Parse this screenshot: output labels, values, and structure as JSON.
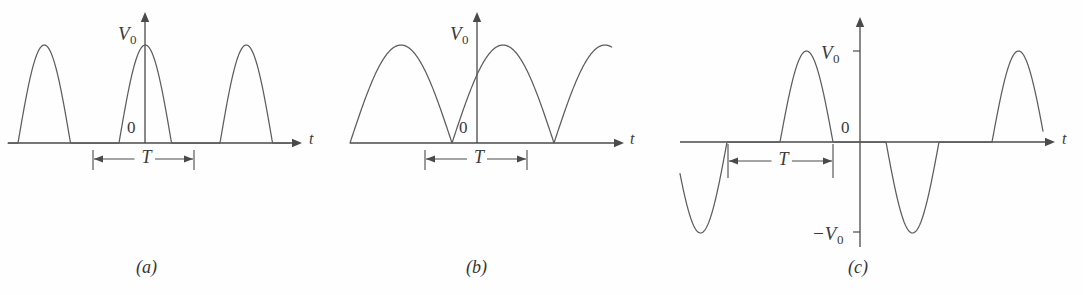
{
  "figure": {
    "width": 1083,
    "height": 295,
    "background": "#fefefe",
    "line_color": "#5d5d5d",
    "axis_color": "#4a4a4a",
    "text_color": "#3a3a3a"
  },
  "panels": [
    {
      "id": "a",
      "caption": "(a)",
      "caption_x": 148,
      "caption_y": 258,
      "waveform_type": "half-wave-rectified-sine",
      "amplitude_label": "V",
      "amplitude_sub": "0",
      "amplitude_label_x": 118,
      "amplitude_label_y": 24,
      "zero_label": "0",
      "zero_label_x": 127,
      "zero_label_y": 119,
      "time_axis_label": "t",
      "time_axis_label_x": 309,
      "time_axis_label_y": 131,
      "period_label": "T",
      "origin_x": 145,
      "baseline_y": 143,
      "amplitude_px": 98,
      "period_px": 101,
      "duty": 0.52,
      "phase_offset_px": -26,
      "wave_start_x": 8,
      "wave_end_x": 290,
      "axis_x_start": 8,
      "axis_x_end": 302,
      "axis_y_top": 12,
      "dim_y": 159,
      "dim_x1": 93,
      "dim_x2": 194,
      "dim_tick_top": 150,
      "dim_tick_bottom": 170
    },
    {
      "id": "b",
      "caption": "(b)",
      "caption_x": 478,
      "caption_y": 258,
      "waveform_type": "full-wave-rectified-sine",
      "amplitude_label": "V",
      "amplitude_sub": "0",
      "amplitude_label_x": 450,
      "amplitude_label_y": 24,
      "zero_label": "0",
      "zero_label_x": 459,
      "zero_label_y": 119,
      "time_axis_label": "t",
      "time_axis_label_x": 630,
      "time_axis_label_y": 131,
      "period_label": "T",
      "origin_x": 477,
      "baseline_y": 143,
      "amplitude_px": 98,
      "period_px": 102,
      "duty": 1.0,
      "phase_offset_px": -25,
      "wave_start_x": 350,
      "wave_end_x": 612,
      "axis_x_start": 350,
      "axis_x_end": 624,
      "axis_y_top": 12,
      "dim_y": 159,
      "dim_x1": 425,
      "dim_x2": 527,
      "dim_tick_top": 150,
      "dim_tick_bottom": 170
    },
    {
      "id": "c",
      "caption": "(c)",
      "caption_x": 860,
      "caption_y": 258,
      "waveform_type": "alternating-gapped-sine",
      "amplitude_label": "V",
      "amplitude_sub": "0",
      "amplitude_label_x": 821,
      "amplitude_label_y": 43,
      "neg_amplitude_label": "−V",
      "neg_amplitude_sub": "0",
      "neg_amplitude_label_x": 812,
      "neg_amplitude_label_y": 224,
      "zero_label": "0",
      "zero_label_x": 841,
      "zero_label_y": 119,
      "time_axis_label": "t",
      "time_axis_label_x": 1062,
      "time_axis_label_y": 131,
      "period_label": "T",
      "origin_x": 860,
      "baseline_y": 142,
      "amplitude_px": 91,
      "period_px": 106,
      "duty": 0.5,
      "phase_offset_px": -80,
      "wave_start_x": 680,
      "wave_end_x": 1043,
      "axis_x_start": 680,
      "axis_x_end": 1055,
      "axis_y_top": 17,
      "axis_y_bottom": 247,
      "tick_pos_y": 51,
      "tick_neg_y": 232,
      "tick_len": 7,
      "dim_y": 161,
      "dim_x1": 728,
      "dim_x2": 833,
      "dim_tick_top": 144,
      "dim_tick_bottom": 178
    }
  ],
  "chart_data": {
    "type": "line",
    "xlabel": "t",
    "ylabel": "V",
    "grid": false,
    "legend": "none",
    "series": [
      {
        "name": "(a) half-wave rectified",
        "description": "Sine half-cycles of amplitude V0 separated by flat zero intervals; period T measured from the start of one hump to the start of the next.",
        "amplitude": "V0",
        "minimum": 0,
        "period": "T",
        "conduction_fraction": 0.52,
        "humps_visible": 3
      },
      {
        "name": "(b) full-wave rectified",
        "description": "Contiguous sine half-cycles of amplitude V0 touching the zero axis; T spans two humps (one original sine period).",
        "amplitude": "V0",
        "minimum": 0,
        "period": "T",
        "conduction_fraction": 1.0,
        "humps_visible": 6
      },
      {
        "name": "(c) alternating with gaps",
        "description": "Positive hump to +V0, flat gap, negative hump to -V0, flat gap; period T spans one positive-plus-gap interval.",
        "amplitude": "V0",
        "minimum": "-V0",
        "period": "T",
        "conduction_fraction": 0.5,
        "humps_visible": 4
      }
    ],
    "axis_ticks": {
      "a": [
        "0",
        "V0"
      ],
      "b": [
        "0",
        "V0"
      ],
      "c": [
        "-V0",
        "0",
        "V0"
      ]
    }
  }
}
